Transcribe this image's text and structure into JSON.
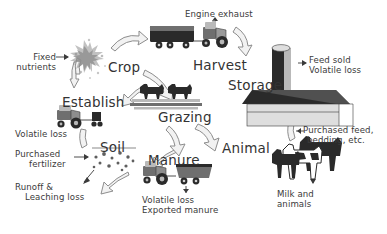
{
  "diagram": {
    "type": "cycle-diagram",
    "stages": [
      {
        "id": "crop",
        "label": "Crop",
        "x": 108,
        "y": 60,
        "icon": "crop-plant-icon"
      },
      {
        "id": "harvest",
        "label": "Harvest",
        "x": 193,
        "y": 58,
        "icon": "harvest-truck-tractor-icon"
      },
      {
        "id": "storage",
        "label": "Storage",
        "x": 228,
        "y": 78,
        "icon": "storage-barn-silo-icon"
      },
      {
        "id": "animal",
        "label": "Animal",
        "x": 222,
        "y": 141,
        "icon": "cattle-icon"
      },
      {
        "id": "manure",
        "label": "Manure",
        "x": 148,
        "y": 153,
        "icon": "manure-spreader-tractor-icon"
      },
      {
        "id": "soil",
        "label": "Soil",
        "x": 100,
        "y": 140,
        "icon": "soil-particles-icon"
      },
      {
        "id": "establish",
        "label": "Establish",
        "x": 62,
        "y": 95,
        "icon": "planting-tractor-icon"
      },
      {
        "id": "grazing",
        "label": "Grazing",
        "x": 158,
        "y": 110,
        "icon": "grazing-cattle-pasture-icon"
      }
    ],
    "flows": [
      {
        "id": "fixed-nutrients",
        "lines": [
          "Fixed",
          "nutrients"
        ],
        "direction": "input",
        "x": 38,
        "y": 53
      },
      {
        "id": "engine-exhaust",
        "lines": [
          "Engine exhaust"
        ],
        "direction": "output",
        "x": 185,
        "y": 10
      },
      {
        "id": "feed-sold",
        "lines": [
          "Feed sold",
          "Volatile loss"
        ],
        "direction": "output",
        "x": 309,
        "y": 56
      },
      {
        "id": "purchased-feed",
        "lines": [
          "Purchased feed,",
          "bedding, etc."
        ],
        "direction": "input",
        "x": 303,
        "y": 126
      },
      {
        "id": "milk-and-animals",
        "lines": [
          "Milk and",
          "animals"
        ],
        "direction": "output",
        "x": 277,
        "y": 190
      },
      {
        "id": "manure-losses",
        "lines": [
          "Volatile loss",
          "Exported manure"
        ],
        "direction": "output",
        "x": 142,
        "y": 196
      },
      {
        "id": "soil-volatile-loss",
        "lines": [
          "Volatile loss"
        ],
        "direction": "output",
        "x": 15,
        "y": 130
      },
      {
        "id": "purchased-fertilizer",
        "lines": [
          "Purchased",
          "fertilizer"
        ],
        "direction": "input",
        "x": 15,
        "y": 150
      },
      {
        "id": "runoff-leaching",
        "lines": [
          "Runoff &",
          "Leaching loss"
        ],
        "direction": "output",
        "x": 15,
        "y": 183
      }
    ],
    "colors": {
      "background": "#ffffff",
      "text": "#333333",
      "arrow_fill": "#f2f2f2",
      "arrow_stroke": "#8d8d8d",
      "icon_dark": "#2a2a2a",
      "icon_mid": "#6f6f6f",
      "icon_light": "#b9b9b9"
    }
  }
}
